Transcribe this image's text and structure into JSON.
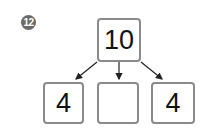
{
  "problem_number": "12",
  "top_box": {
    "value": "10"
  },
  "bottom_boxes": [
    {
      "value": "4"
    },
    {
      "value": ""
    },
    {
      "value": "4"
    }
  ],
  "colors": {
    "border": "#8a8a8a",
    "badge": "#6a6a6a",
    "text": "#111111"
  }
}
